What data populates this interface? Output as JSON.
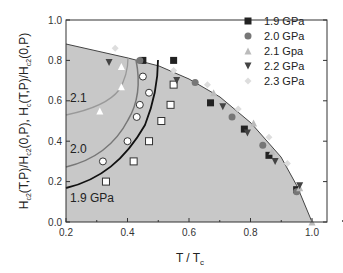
{
  "chart_data": {
    "type": "scatter",
    "title": "",
    "xlabel": "T / T_c",
    "ylabel": "H_c2(T,P)/H_c2(0,P),  H_c(T,P)/H_c2(0,P)",
    "xlim": [
      0.2,
      1.1
    ],
    "ylim": [
      0.0,
      1.0
    ],
    "x_ticks": [
      "0.2",
      "0.4",
      "0.6",
      "0.8",
      "1.0"
    ],
    "y_ticks": [
      "0.0",
      "0.2",
      "0.4",
      "0.6",
      "0.8",
      "1.0"
    ],
    "legend_position": "upper right",
    "legend": [
      "1.9 GPa",
      "2.0 GPa",
      "2.1 Gpa",
      "2.2 GPa",
      "2.3 GPa"
    ],
    "annotations": [
      "2.1",
      "2.0",
      "1.9 GPa"
    ],
    "series": [
      {
        "name": "1.9 GPa",
        "marker": "square",
        "color": "#222222",
        "points": [
          [
            0.45,
            0.8
          ],
          [
            0.55,
            0.8
          ],
          [
            0.55,
            0.68
          ],
          [
            0.54,
            0.58
          ],
          [
            0.51,
            0.5
          ],
          [
            0.47,
            0.4
          ],
          [
            0.42,
            0.3
          ],
          [
            0.33,
            0.2
          ],
          [
            0.67,
            0.59
          ],
          [
            0.78,
            0.46
          ],
          [
            0.86,
            0.33
          ],
          [
            0.95,
            0.16
          ]
        ]
      },
      {
        "name": "2.0 GPa",
        "marker": "circle",
        "color": "#777777",
        "points": [
          [
            0.44,
            0.8
          ],
          [
            0.45,
            0.72
          ],
          [
            0.47,
            0.64
          ],
          [
            0.44,
            0.58
          ],
          [
            0.43,
            0.52
          ],
          [
            0.4,
            0.4
          ],
          [
            0.32,
            0.3
          ],
          [
            0.62,
            0.69
          ],
          [
            0.74,
            0.52
          ],
          [
            0.84,
            0.38
          ],
          [
            0.95,
            0.15
          ]
        ]
      },
      {
        "name": "2.1 Gpa",
        "marker": "triangle-up",
        "color": "#bbbbbb",
        "points": [
          [
            0.38,
            0.77
          ],
          [
            0.38,
            0.67
          ],
          [
            0.31,
            0.55
          ],
          [
            0.68,
            0.64
          ],
          [
            0.81,
            0.49
          ],
          [
            0.87,
            0.35
          ],
          [
            0.96,
            0.17
          ],
          [
            1.0,
            0.0
          ]
        ]
      },
      {
        "name": "2.2 GPa",
        "marker": "triangle-down",
        "color": "#444444",
        "points": [
          [
            0.34,
            0.79
          ],
          [
            0.56,
            0.7
          ],
          [
            0.71,
            0.57
          ],
          [
            0.79,
            0.44
          ],
          [
            0.88,
            0.3
          ],
          [
            0.96,
            0.18
          ]
        ]
      },
      {
        "name": "2.3 GPa",
        "marker": "diamond",
        "color": "#dddddd",
        "points": [
          [
            0.36,
            0.86
          ],
          [
            0.55,
            0.75
          ],
          [
            0.66,
            0.68
          ],
          [
            0.76,
            0.56
          ],
          [
            0.86,
            0.42
          ],
          [
            0.92,
            0.29
          ]
        ]
      }
    ],
    "curves": [
      {
        "label": "1.9 GPa",
        "x": [
          0.2,
          0.3,
          0.4,
          0.47,
          0.51,
          0.54,
          0.55,
          0.55
        ],
        "y": [
          0.17,
          0.2,
          0.27,
          0.4,
          0.5,
          0.6,
          0.7,
          0.8
        ]
      },
      {
        "label": "2.0",
        "x": [
          0.2,
          0.3,
          0.38,
          0.43,
          0.45,
          0.45,
          0.44
        ],
        "y": [
          0.27,
          0.32,
          0.42,
          0.52,
          0.62,
          0.72,
          0.8
        ]
      },
      {
        "label": "2.1",
        "x": [
          0.2,
          0.28,
          0.34,
          0.38,
          0.39
        ],
        "y": [
          0.53,
          0.56,
          0.62,
          0.7,
          0.79
        ]
      },
      {
        "label": "boundary",
        "x": [
          0.2,
          0.4,
          0.5,
          0.6,
          0.7,
          0.8,
          0.9,
          0.95,
          1.0
        ],
        "y": [
          0.88,
          0.81,
          0.77,
          0.71,
          0.62,
          0.49,
          0.32,
          0.18,
          0.0
        ]
      }
    ]
  }
}
